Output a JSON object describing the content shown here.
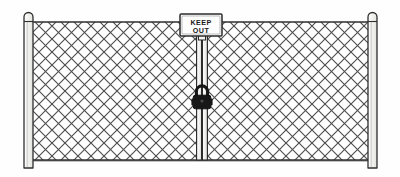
{
  "illustration": {
    "title": "Chain Link Fence With Keep Out Sign And Padlock",
    "background_color": "#fefefe",
    "line_color": "#3a3a3a",
    "mesh_color": "#555555",
    "post_fill": "#f4f4f2",
    "sign_fill": "#ffffff",
    "lock_fill": "#171717"
  },
  "sign": {
    "line1": "KEEP",
    "line2": "OUT",
    "x": 180,
    "y": 14,
    "width": 42,
    "height": 22,
    "border_color": "#2b2b2b",
    "fill": "#ffffff"
  },
  "padlock": {
    "label": "padlock",
    "center_x": 202,
    "center_y": 100,
    "body_width": 18,
    "body_height": 14,
    "fill": "#171717"
  },
  "posts": [
    {
      "name": "left-post",
      "x": 24,
      "top": 12,
      "bottom": 166,
      "width": 9,
      "cap": "dome"
    },
    {
      "name": "right-post",
      "x": 368,
      "top": 12,
      "bottom": 166,
      "width": 9,
      "cap": "dome"
    }
  ],
  "gate": {
    "center_x": 202,
    "left_stile_x": 199,
    "right_stile_x": 205,
    "top": 36,
    "bottom": 160,
    "panels": 2
  },
  "rails": {
    "top_y": 22,
    "bottom_y": 160,
    "left_x": 33,
    "right_x": 368
  },
  "mesh": {
    "pattern": "diagonal-diamond",
    "cell_size": 13,
    "stroke_width": 1.1,
    "regions": [
      {
        "name": "left-panel",
        "x": 33,
        "y": 22,
        "width": 166,
        "height": 138
      },
      {
        "name": "right-panel",
        "x": 205,
        "y": 22,
        "width": 163,
        "height": 138
      }
    ]
  }
}
